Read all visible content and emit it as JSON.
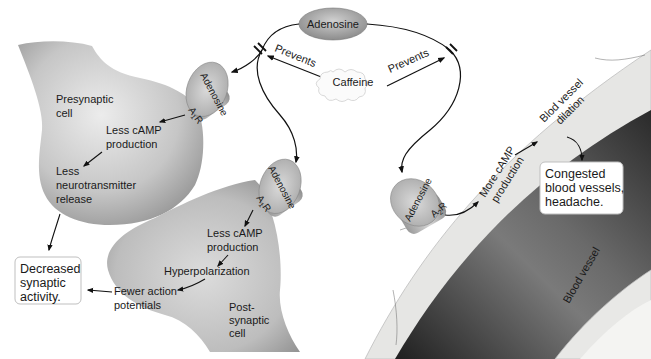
{
  "diagram": {
    "top": {
      "adenosine_label": "Adenosine",
      "caffeine_label": "Caffeine",
      "prevents_left": "Prevents",
      "prevents_right": "Prevents"
    },
    "presynaptic": {
      "cell_label_1": "Presynaptic",
      "cell_label_2": "cell",
      "receptor_ligand": "Adenosine",
      "receptor_name": "A",
      "receptor_sub": "1",
      "receptor_suffix": "R",
      "step1_line1": "Less cAMP",
      "step1_line2": "production",
      "step2_line1": "Less",
      "step2_line2": "neurotransmitter",
      "step2_line3": "release"
    },
    "postsynaptic": {
      "cell_label_1": "Post-",
      "cell_label_2": "synaptic",
      "cell_label_3": "cell",
      "receptor_ligand": "Adenosine",
      "receptor_name": "A",
      "receptor_sub": "1",
      "receptor_suffix": "R",
      "step1_line1": "Less cAMP",
      "step1_line2": "production",
      "step2": "Hyperpolarization",
      "step3_line1": "Fewer action",
      "step3_line2": "potentials"
    },
    "outcome_left": {
      "line1": "Decreased",
      "line2": "synaptic",
      "line3": "activity."
    },
    "vessel": {
      "receptor_ligand": "Adenosine",
      "receptor_name": "A",
      "receptor_sub": "2",
      "receptor_suffix": "R",
      "step1_line1": "More cAMP",
      "step1_line2": "production",
      "step2_line1": "Blod vessel",
      "step2_line2": "dilation",
      "vessel_label": "Blood vessel"
    },
    "outcome_right": {
      "line1": "Congested",
      "line2": "blood vessels,",
      "line3": "headache."
    },
    "colors": {
      "cell_gray": "#b8b8b8",
      "vessel_wall": "#e4e4e2",
      "vessel_lumen_dark": "#3a3a3a",
      "adenosine_oval": "#a9a9a9",
      "text": "#1a1a1a"
    }
  }
}
